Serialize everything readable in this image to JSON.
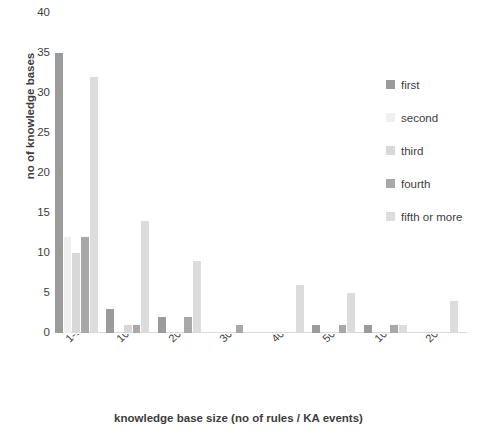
{
  "chart_data": {
    "type": "bar",
    "title": "",
    "xlabel": "knowledge base size (no of rules / KA events)",
    "ylabel": "no of knowledge bases",
    "ylim": [
      0,
      40
    ],
    "yticks": [
      40,
      35,
      30,
      25,
      20,
      15,
      10,
      5,
      0
    ],
    "grid": false,
    "legend_position": "right",
    "categories": [
      "1-100",
      "101-200",
      "201-300",
      "301-400",
      "401-500",
      "501-1000",
      "1001-2000",
      "200"
    ],
    "series": [
      {
        "name": "first",
        "color": "#9b9b9b",
        "values": [
          35,
          3,
          2,
          0,
          0,
          1,
          1,
          0
        ]
      },
      {
        "name": "second",
        "color": "#efefef",
        "values": [
          12,
          0,
          0,
          0,
          0,
          0,
          0,
          0
        ]
      },
      {
        "name": "third",
        "color": "#d8d8d8",
        "values": [
          10,
          1,
          0,
          0,
          0,
          0,
          0,
          0
        ]
      },
      {
        "name": "fourth",
        "color": "#a8a8a8",
        "values": [
          12,
          1,
          2,
          1,
          0,
          1,
          1,
          0
        ]
      },
      {
        "name": "fifth or more",
        "color": "#dcdcdc",
        "values": [
          32,
          14,
          9,
          0,
          6,
          5,
          1,
          4
        ]
      }
    ]
  },
  "axis": {
    "y_title": "no of knowledge bases",
    "x_title": "knowledge base size (no of rules / KA events)",
    "y_ticks": [
      "40",
      "35",
      "30",
      "25",
      "20",
      "15",
      "10",
      "5",
      "0"
    ]
  },
  "legend": {
    "items": [
      {
        "label": "first"
      },
      {
        "label": "second"
      },
      {
        "label": "third"
      },
      {
        "label": "fourth"
      },
      {
        "label": "fifth or more"
      }
    ]
  },
  "title": {
    "text": ""
  }
}
